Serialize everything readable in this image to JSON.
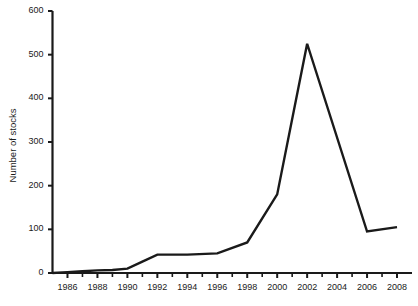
{
  "chart_data": {
    "type": "line",
    "title": "",
    "xlabel": "",
    "ylabel": "Number of stocks",
    "xlim": [
      1985,
      2009
    ],
    "ylim": [
      0,
      600
    ],
    "grid": false,
    "legend": null,
    "y_ticks": [
      0,
      100,
      200,
      300,
      400,
      500,
      600
    ],
    "y_tick_labels": [
      "0",
      "100",
      "200",
      "300",
      "400",
      "500",
      "600"
    ],
    "x_ticks": [
      1986,
      1988,
      1990,
      1992,
      1994,
      1996,
      1998,
      2000,
      2002,
      2004,
      2006,
      2008
    ],
    "x_tick_labels": [
      "1986",
      "1988",
      "1990",
      "1992",
      "1994",
      "1996",
      "1998",
      "2000",
      "2002",
      "2004",
      "2006",
      "2008"
    ],
    "x_minor_ticks": [
      1987,
      1989,
      1991,
      1993,
      1995,
      1997,
      1999,
      2001,
      2003,
      2005,
      2007
    ],
    "series": [
      {
        "name": "Number of stocks",
        "color": "#1a1a1a",
        "line_width": 2.4,
        "x": [
          1985,
          1986,
          1987,
          1988,
          1989,
          1990,
          1991,
          1992,
          1994,
          1996,
          1998,
          2000,
          2002,
          2006,
          2008
        ],
        "values": [
          0,
          2,
          4,
          6,
          7,
          10,
          26,
          42,
          42,
          45,
          70,
          180,
          525,
          95,
          105
        ]
      }
    ]
  },
  "axes": {
    "y_axis_title": "Number of stocks"
  }
}
